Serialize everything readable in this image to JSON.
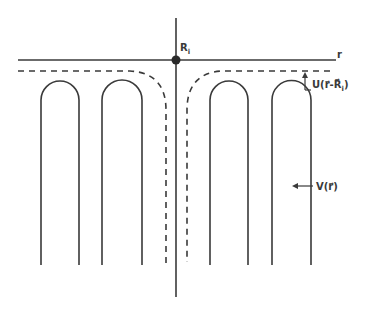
{
  "diagram": {
    "title": "",
    "colors": {
      "ink": "#3a3a3a",
      "background": "#ffffff"
    },
    "axes": {
      "horizontal_label": "r",
      "origin_label": "R",
      "origin_label_subscript": "i"
    },
    "labels": {
      "u_potential": "U(r⃗-R⃗",
      "u_potential_subscript": "i",
      "u_potential_close": ")",
      "v_potential": "V(r⃗)"
    },
    "elements": {
      "wells": [
        {
          "name": "left-outer-well",
          "x_left": 41,
          "x_right": 79
        },
        {
          "name": "left-inner-well",
          "x_left": 102,
          "x_right": 142
        },
        {
          "name": "right-inner-well",
          "x_left": 210,
          "x_right": 248
        },
        {
          "name": "right-outer-well",
          "x_left": 272,
          "x_right": 311
        }
      ],
      "dashed_curves": [
        "left-dashed-potential",
        "right-dashed-potential"
      ]
    }
  }
}
